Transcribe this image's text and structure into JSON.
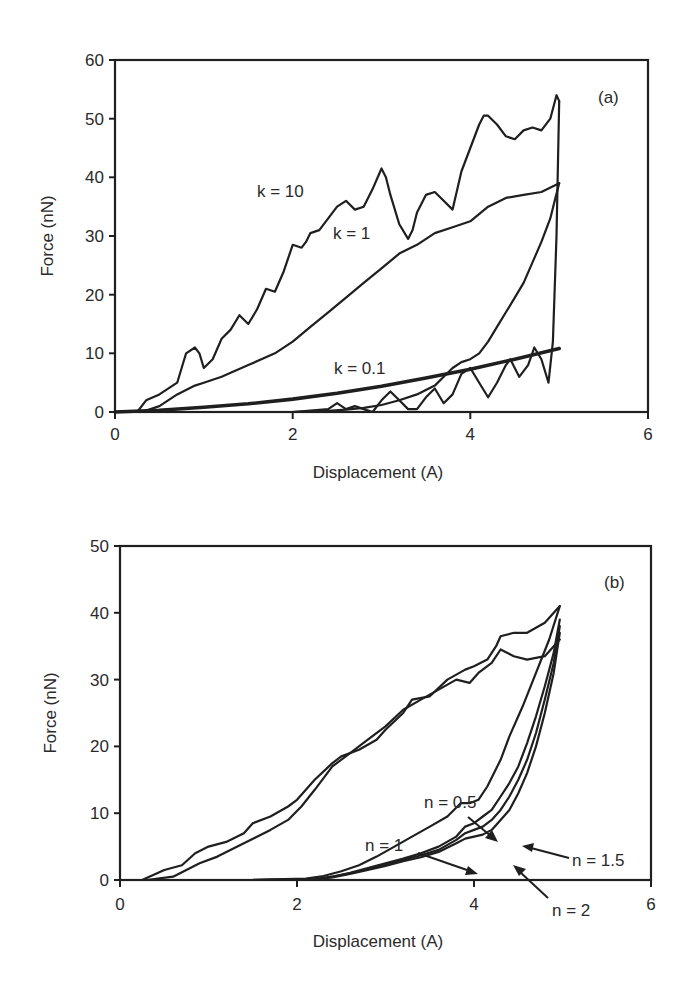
{
  "chart_data": [
    {
      "panel": "(a)",
      "type": "line",
      "title": "",
      "xlabel": "Displacement (A)",
      "ylabel": "Force (nN)",
      "xlim": [
        0,
        6
      ],
      "ylim": [
        0,
        60
      ],
      "xticks": [
        0,
        2,
        4,
        6
      ],
      "yticks": [
        0,
        10,
        20,
        30,
        40,
        50,
        60
      ],
      "grid": false,
      "legend": "none (inline annotations)",
      "annotations": [
        {
          "text": "(a)",
          "x": 5.45,
          "y": 54
        },
        {
          "text": "k = 10",
          "x": 1.6,
          "y": 33
        },
        {
          "text": "k = 1",
          "x": 2.45,
          "y": 29
        },
        {
          "text": "k = 0.1",
          "x": 2.45,
          "y": 6.5
        }
      ],
      "series": [
        {
          "name": "k = 10 (approach)",
          "x": [
            0.0,
            0.25,
            0.35,
            0.5,
            0.7,
            0.8,
            0.9,
            0.95,
            1.0,
            1.1,
            1.2,
            1.3,
            1.4,
            1.5,
            1.6,
            1.7,
            1.8,
            1.9,
            2.0,
            2.1,
            2.15,
            2.2,
            2.3,
            2.4,
            2.5,
            2.6,
            2.7,
            2.8,
            2.9,
            3.0,
            3.05,
            3.1,
            3.2,
            3.3,
            3.35,
            3.4,
            3.5,
            3.6,
            3.7,
            3.8,
            3.9,
            4.0,
            4.1,
            4.15,
            4.2,
            4.3,
            4.4,
            4.5,
            4.6,
            4.7,
            4.8,
            4.9,
            4.97,
            5.0
          ],
          "y": [
            0,
            0,
            2,
            3,
            5,
            10,
            11,
            10,
            7.5,
            9,
            12.5,
            14,
            16.5,
            15,
            17.5,
            21,
            20.5,
            24,
            28.5,
            28,
            29,
            30.5,
            31,
            33,
            35,
            36,
            34.5,
            35,
            38,
            41.5,
            40,
            37,
            32,
            29.5,
            31,
            34,
            37,
            37.5,
            36,
            34.5,
            41,
            45,
            49,
            50.5,
            50.5,
            49,
            47,
            46.5,
            48,
            48.5,
            48,
            50,
            54,
            53
          ]
        },
        {
          "name": "k = 10 (retract)",
          "x": [
            5.0,
            4.97,
            4.93,
            4.88,
            4.8,
            4.72,
            4.65,
            4.55,
            4.45,
            4.4,
            4.3,
            4.2,
            4.1,
            4.0,
            3.9,
            3.8,
            3.7,
            3.6,
            3.5,
            3.4,
            3.3,
            3.2,
            3.1,
            3.0,
            2.9,
            2.8,
            2.7,
            2.6,
            2.5,
            2.4,
            2.0,
            1.0,
            0.3
          ],
          "y": [
            53,
            30,
            12,
            5,
            9,
            11,
            8,
            6,
            9,
            8,
            5,
            2.5,
            5,
            7.5,
            6.5,
            3,
            1.5,
            4,
            2.5,
            0.5,
            0.5,
            2,
            3.5,
            2,
            0,
            0.5,
            1,
            0.5,
            1.5,
            0.5,
            0,
            0,
            0
          ]
        },
        {
          "name": "k = 1 (approach)",
          "x": [
            0.0,
            0.3,
            0.5,
            0.7,
            0.9,
            1.0,
            1.2,
            1.5,
            1.8,
            2.0,
            2.2,
            2.4,
            2.6,
            2.8,
            3.0,
            3.2,
            3.4,
            3.6,
            3.8,
            4.0,
            4.2,
            4.4,
            4.6,
            4.8,
            5.0
          ],
          "y": [
            0,
            0,
            1,
            3,
            4.5,
            5,
            6,
            8,
            10,
            12,
            14.5,
            17,
            19.5,
            22,
            24.5,
            27,
            28.5,
            30.5,
            31.5,
            32.5,
            35,
            36.5,
            37,
            37.5,
            39
          ]
        },
        {
          "name": "k = 1 (retract)",
          "x": [
            5.0,
            4.95,
            4.9,
            4.8,
            4.7,
            4.6,
            4.5,
            4.4,
            4.3,
            4.2,
            4.1,
            4.0,
            3.9,
            3.8,
            3.7,
            3.6,
            3.4,
            3.2,
            3.0,
            2.8,
            2.6,
            2.4,
            2.2,
            2.0,
            1.0,
            0.3
          ],
          "y": [
            39,
            36,
            33,
            29,
            25.5,
            22,
            19.5,
            17,
            14.5,
            12,
            10,
            9,
            8.5,
            7.5,
            6,
            4.5,
            3,
            2,
            1.2,
            0.7,
            0.4,
            0.2,
            0.1,
            0,
            0,
            0
          ]
        },
        {
          "name": "k = 0.1",
          "x": [
            0.0,
            0.5,
            1.0,
            1.5,
            2.0,
            2.5,
            3.0,
            3.5,
            4.0,
            4.5,
            5.0
          ],
          "y": [
            0,
            0.3,
            0.8,
            1.4,
            2.2,
            3.2,
            4.4,
            5.8,
            7.3,
            9.0,
            10.8
          ]
        }
      ]
    },
    {
      "panel": "(b)",
      "type": "line",
      "title": "",
      "xlabel": "Displacement (A)",
      "ylabel": "Force (nN)",
      "xlim": [
        0,
        6
      ],
      "ylim": [
        0,
        50
      ],
      "xticks": [
        0,
        2,
        4,
        6
      ],
      "yticks": [
        0,
        10,
        20,
        30,
        40,
        50
      ],
      "grid": false,
      "legend": "none (inline annotations with arrows)",
      "annotations": [
        {
          "text": "(b)",
          "x": 5.45,
          "y": 45
        },
        {
          "text": "n = 0.5",
          "x": 3.35,
          "y": 23.5,
          "arrow_to": [
            4.25,
            17.5
          ]
        },
        {
          "text": "n = 1",
          "x": 2.75,
          "y": 13,
          "arrow_to": [
            4.1,
            10
          ]
        },
        {
          "text": "n = 1.5",
          "x": 5.1,
          "y": 11.5,
          "arrow_to": [
            4.55,
            13.5
          ]
        },
        {
          "text": "n = 2",
          "x": 4.85,
          "y": 4.5,
          "arrow_to": [
            4.45,
            9.5
          ]
        }
      ],
      "series": [
        {
          "name": "approach (all n, upper envelope)",
          "x": [
            0.0,
            0.25,
            0.5,
            0.7,
            0.85,
            1.0,
            1.2,
            1.4,
            1.5,
            1.7,
            1.9,
            2.0,
            2.2,
            2.4,
            2.5,
            2.7,
            2.9,
            3.0,
            3.2,
            3.3,
            3.5,
            3.7,
            3.9,
            4.0,
            4.15,
            4.25,
            4.3,
            4.45,
            4.6,
            4.8,
            4.97
          ],
          "y": [
            0,
            0,
            1.5,
            2.2,
            4,
            5,
            5.7,
            7,
            8.5,
            9.5,
            11,
            12,
            15,
            17.5,
            18.5,
            19.5,
            21,
            22.5,
            25,
            27,
            27.5,
            30,
            31.5,
            32,
            33,
            35,
            36.5,
            37,
            37,
            38.5,
            41
          ]
        },
        {
          "name": "approach (all n, lower envelope)",
          "x": [
            0.0,
            0.3,
            0.6,
            0.9,
            1.1,
            1.4,
            1.7,
            1.9,
            2.05,
            2.2,
            2.4,
            2.6,
            2.8,
            3.0,
            3.2,
            3.4,
            3.6,
            3.8,
            3.95,
            4.05,
            4.2,
            4.3,
            4.45,
            4.6,
            4.8,
            4.97
          ],
          "y": [
            0,
            0,
            0.5,
            2.5,
            3.5,
            5.5,
            7.5,
            9,
            11,
            13.5,
            17,
            19,
            21,
            23,
            25.5,
            27,
            28.5,
            30,
            29.5,
            31,
            32.5,
            34.5,
            33.5,
            33,
            33.5,
            36
          ]
        },
        {
          "name": "n = 0.5 (retract)",
          "x": [
            4.97,
            4.85,
            4.7,
            4.55,
            4.4,
            4.3,
            4.15,
            4.05,
            3.95,
            3.85,
            3.7,
            3.5,
            3.3,
            3.1,
            2.9,
            2.7,
            2.5,
            2.3,
            2.1,
            1.5,
            0.8
          ],
          "y": [
            41,
            36,
            31,
            26,
            21.5,
            18,
            14,
            12,
            11.5,
            11.5,
            9.5,
            8,
            6.5,
            5,
            3.5,
            2.2,
            1.3,
            0.6,
            0.2,
            0,
            0
          ]
        },
        {
          "name": "n = 1 (retract)",
          "x": [
            4.97,
            4.9,
            4.8,
            4.7,
            4.6,
            4.5,
            4.4,
            4.3,
            4.2,
            4.1,
            4.0,
            3.9,
            3.8,
            3.6,
            3.4,
            3.2,
            3.0,
            2.8,
            2.6,
            2.4,
            2.2,
            1.5,
            0.8
          ],
          "y": [
            39,
            34,
            29,
            24.5,
            20.5,
            17,
            14.5,
            12.5,
            10.5,
            9.5,
            8.5,
            8,
            6.5,
            5,
            4,
            3.2,
            2.5,
            1.8,
            1.1,
            0.5,
            0.1,
            0,
            0
          ]
        },
        {
          "name": "n = 1.5 (retract)",
          "x": [
            4.97,
            4.9,
            4.8,
            4.7,
            4.6,
            4.5,
            4.4,
            4.3,
            4.2,
            4.1,
            4.0,
            3.9,
            3.8,
            3.6,
            3.4,
            3.2,
            3.0,
            2.8,
            2.6,
            2.4,
            2.2,
            1.5,
            0.8
          ],
          "y": [
            38,
            32.5,
            27,
            22,
            18,
            15,
            12.5,
            10.5,
            9,
            8,
            7.5,
            7,
            6,
            4.5,
            3.7,
            3,
            2.3,
            1.6,
            1,
            0.5,
            0.1,
            0,
            0
          ]
        },
        {
          "name": "n = 2 (retract)",
          "x": [
            4.97,
            4.9,
            4.8,
            4.7,
            4.6,
            4.5,
            4.4,
            4.3,
            4.2,
            4.1,
            4.0,
            3.9,
            3.8,
            3.6,
            3.4,
            3.2,
            3.0,
            2.8,
            2.6,
            2.4,
            2.2,
            1.5,
            0.8
          ],
          "y": [
            37,
            31,
            25,
            20,
            16,
            13,
            10.5,
            9,
            7.5,
            6.8,
            6.5,
            6.2,
            5.5,
            4.2,
            3.4,
            2.8,
            2.1,
            1.5,
            0.9,
            0.4,
            0.1,
            0,
            0
          ]
        }
      ]
    }
  ],
  "panels": {
    "a": {
      "label": "(a)",
      "xlabel": "Displacement (A)",
      "ylabel": "Force (nN)",
      "yticks": [
        "0",
        "10",
        "20",
        "30",
        "40",
        "50",
        "60"
      ],
      "xticks": [
        "0",
        "2",
        "4",
        "6"
      ],
      "annotations": {
        "k10": "k = 10",
        "k1": "k = 1",
        "k01": "k = 0.1"
      }
    },
    "b": {
      "label": "(b)",
      "xlabel": "Displacement (A)",
      "ylabel": "Force (nN)",
      "yticks": [
        "0",
        "10",
        "20",
        "30",
        "40",
        "50"
      ],
      "xticks": [
        "0",
        "2",
        "4",
        "6"
      ],
      "annotations": {
        "n05": "n = 0.5",
        "n1": "n = 1",
        "n15": "n = 1.5",
        "n2": "n = 2"
      }
    }
  }
}
